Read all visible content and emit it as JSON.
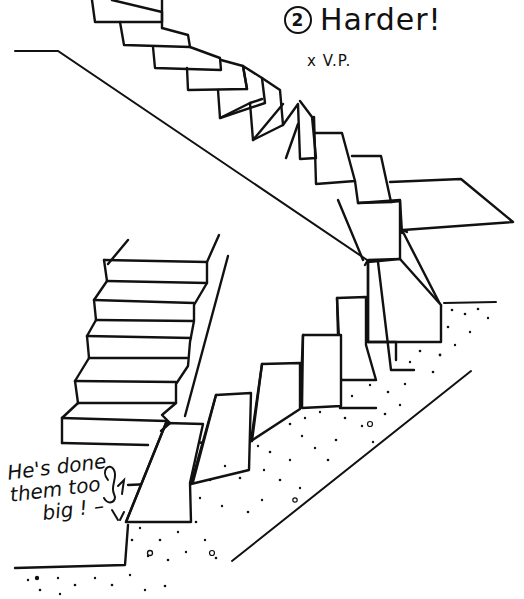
{
  "sketch": {
    "title": {
      "number": "2",
      "text": "Harder!"
    },
    "vanishing_point_label": "x V.P.",
    "annotation": {
      "lines": [
        "He's done",
        "them too",
        "big ! –"
      ]
    },
    "elements": [
      "upper-flight-stairs",
      "landing",
      "lower-flight-stairs",
      "left-background-stairs",
      "stringer-line",
      "stippled-ground",
      "small-figure"
    ],
    "ink_color": "#111111",
    "paper_color": "#ffffff"
  }
}
